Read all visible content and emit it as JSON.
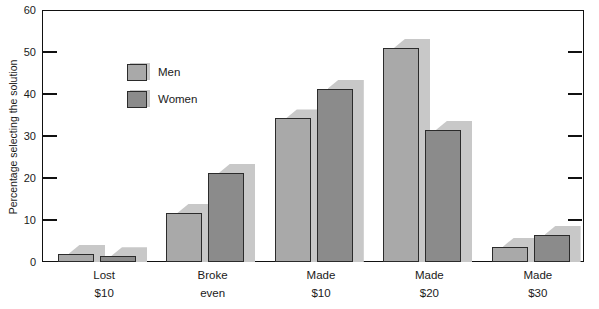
{
  "chart_data": {
    "type": "bar",
    "title": "",
    "subtitle": "",
    "xlabel": "",
    "ylabel": "Percentage selecting the solution",
    "categories": [
      "Lost $10",
      "Broke even",
      "Made $10",
      "Made $20",
      "Made $30"
    ],
    "category_lines": [
      {
        "line1": "Lost",
        "line2": "$10"
      },
      {
        "line1": "Broke",
        "line2": "even"
      },
      {
        "line1": "Made",
        "line2": "$10"
      },
      {
        "line1": "Made",
        "line2": "$20"
      },
      {
        "line1": "Made",
        "line2": "$30"
      }
    ],
    "series": [
      {
        "name": "Men",
        "color": "#a9a9a9",
        "values": [
          2.0,
          11.7,
          34.2,
          51.0,
          3.6
        ]
      },
      {
        "name": "Women",
        "color": "#8b8b8b",
        "values": [
          1.4,
          21.3,
          41.3,
          31.5,
          6.5
        ]
      }
    ],
    "ylim": [
      0,
      60
    ],
    "yticks": [
      0,
      10,
      20,
      30,
      40,
      50,
      60
    ],
    "ytick_labels": [
      "0",
      "10",
      "20",
      "30",
      "40",
      "50",
      "60"
    ],
    "grid": false,
    "legend_position": "inside-upper-left",
    "bar_style": "3d-shadow",
    "shadow_color": "#c8c8c8",
    "axis_color": "#111111",
    "background": "#ffffff"
  },
  "legend": {
    "entries": [
      {
        "label": "Men"
      },
      {
        "label": "Women"
      }
    ]
  }
}
